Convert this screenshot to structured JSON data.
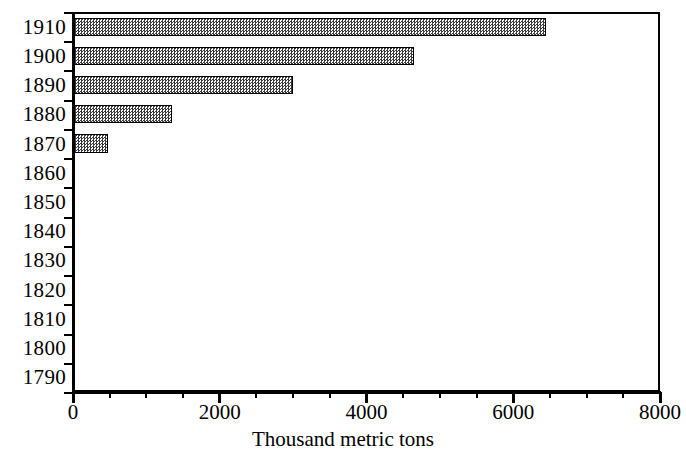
{
  "chart_data": {
    "type": "bar",
    "orientation": "horizontal",
    "title": "",
    "xlabel": "Thousand metric tons",
    "ylabel": "",
    "categories": [
      "1910",
      "1900",
      "1890",
      "1880",
      "1870",
      "1860",
      "1850",
      "1840",
      "1830",
      "1820",
      "1810",
      "1800",
      "1790"
    ],
    "values": [
      6450,
      4650,
      3000,
      1350,
      480,
      0,
      0,
      0,
      0,
      0,
      0,
      0,
      0
    ],
    "xlim": [
      0,
      8000
    ],
    "x_ticks": [
      0,
      2000,
      4000,
      6000,
      8000
    ],
    "x_tick_labels": [
      "0",
      "2000",
      "4000",
      "6000",
      "8000"
    ],
    "x_minor_tick_interval": 500,
    "grid": false,
    "legend": false,
    "bar_fill": "#3a3a3a",
    "bar_pattern": "checkerboard-dither",
    "bar_edge_color": "#000000",
    "background": "#ffffff"
  },
  "axis": {
    "x_title": "Thousand metric tons"
  }
}
